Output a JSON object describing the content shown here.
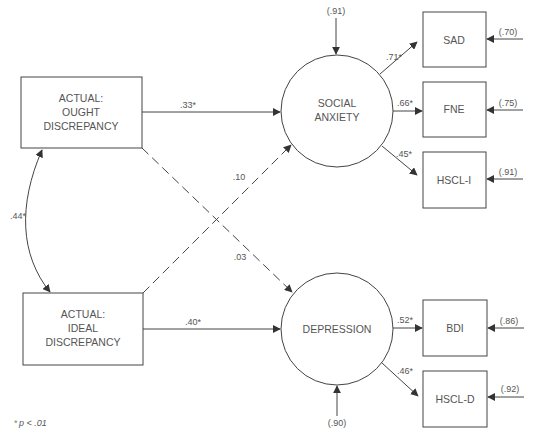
{
  "diagram": {
    "type": "structural-equation-model",
    "colors": {
      "line": "#444444",
      "text": "#555555",
      "background": "#ffffff",
      "note_asterisk": "#4aa36a"
    },
    "observed_predictors": [
      {
        "id": "ought",
        "lines": [
          "ACTUAL:",
          "OUGHT",
          "DISCREPANCY"
        ]
      },
      {
        "id": "ideal",
        "lines": [
          "ACTUAL:",
          "IDEAL",
          "DISCREPANCY"
        ]
      }
    ],
    "latent_factors": [
      {
        "id": "social_anxiety",
        "lines": [
          "SOCIAL",
          "ANXIETY"
        ],
        "disturbance": "(.91)"
      },
      {
        "id": "depression",
        "lines": [
          "DEPRESSION"
        ],
        "disturbance": "(.90)"
      }
    ],
    "indicators": [
      {
        "id": "sad",
        "label": "SAD",
        "factor": "social_anxiety",
        "loading": ".71*",
        "error": "(.70)"
      },
      {
        "id": "fne",
        "label": "FNE",
        "factor": "social_anxiety",
        "loading": ".66*",
        "error": "(.75)"
      },
      {
        "id": "hscl_i",
        "label": "HSCL-I",
        "factor": "social_anxiety",
        "loading": ".45*",
        "error": "(.91)"
      },
      {
        "id": "bdi",
        "label": "BDI",
        "factor": "depression",
        "loading": ".52*",
        "error": "(.86)"
      },
      {
        "id": "hscl_d",
        "label": "HSCL-D",
        "factor": "depression",
        "loading": ".46*",
        "error": "(.92)"
      }
    ],
    "paths": [
      {
        "from": "ought",
        "to": "social_anxiety",
        "coef": ".33*",
        "style": "solid"
      },
      {
        "from": "ideal",
        "to": "social_anxiety",
        "coef": ".10",
        "style": "dashed"
      },
      {
        "from": "ought",
        "to": "depression",
        "coef": ".03",
        "style": "dashed"
      },
      {
        "from": "ideal",
        "to": "depression",
        "coef": ".40*",
        "style": "solid"
      }
    ],
    "correlation": {
      "between": [
        "ought",
        "ideal"
      ],
      "coef": ".44*"
    },
    "note": {
      "asterisk": "*",
      "text": "p < .01"
    }
  }
}
